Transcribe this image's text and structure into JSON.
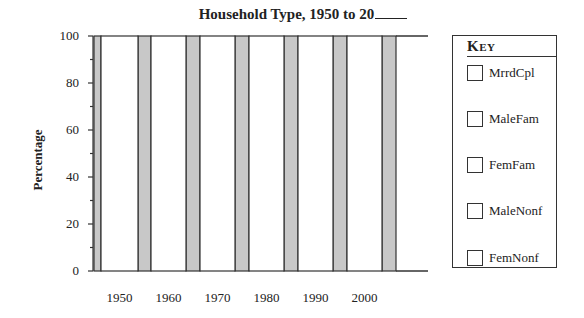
{
  "chart_data": {
    "type": "bar",
    "title_prefix": "Household Type, 1950 to 20",
    "xlabel": "",
    "ylabel": "Percentage",
    "ylim": [
      0,
      100
    ],
    "yticks": [
      0,
      20,
      40,
      60,
      80,
      100
    ],
    "y_minor_tick_step": 10,
    "categories": [
      "1950",
      "1960",
      "1970",
      "1980",
      "1990",
      "2000"
    ],
    "bar_style": "stacked-percent (blank worksheet, bars unfilled)",
    "values_total": [
      100,
      100,
      100,
      100,
      100,
      100
    ],
    "spacer_bars": {
      "count": 7,
      "value": 100,
      "color": "#c8c8c8"
    },
    "series": [
      {
        "name": "MrrdCpl",
        "values": [
          null,
          null,
          null,
          null,
          null,
          null
        ]
      },
      {
        "name": "MaleFam",
        "values": [
          null,
          null,
          null,
          null,
          null,
          null
        ]
      },
      {
        "name": "FemFam",
        "values": [
          null,
          null,
          null,
          null,
          null,
          null
        ]
      },
      {
        "name": "MaleNonf",
        "values": [
          null,
          null,
          null,
          null,
          null,
          null
        ]
      },
      {
        "name": "FemNonf",
        "values": [
          null,
          null,
          null,
          null,
          null,
          null
        ]
      }
    ],
    "legend": {
      "title": "Key",
      "position": "right",
      "entries": [
        "MrrdCpl",
        "MaleFam",
        "FemFam",
        "MaleNonf",
        "FemNonf"
      ]
    },
    "grid": false
  },
  "colors": {
    "spacer": "#c8c8c8",
    "bar_fill": "#ffffff",
    "stroke": "#333333"
  }
}
